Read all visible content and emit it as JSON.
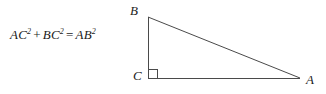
{
  "figure": {
    "background_color": "#ffffff",
    "stroke_color": "#4a4a4a",
    "text_color": "#1b1b1b",
    "width": 326,
    "height": 94
  },
  "equation": {
    "full_text": "AC2 + BC2 = AB2",
    "term1_base": "AC",
    "term1_exponent": "2",
    "operator_plus": "+",
    "term2_base": "BC",
    "term2_exponent": "2",
    "operator_equals": "=",
    "term3_base": "AB",
    "term3_exponent": "2"
  },
  "triangle": {
    "vertices": [
      {
        "name": "B",
        "label": "B",
        "x": 148,
        "y": 17
      },
      {
        "name": "C",
        "label": "C",
        "x": 148,
        "y": 78
      },
      {
        "name": "A",
        "label": "A",
        "x": 300,
        "y": 78
      }
    ],
    "right_angle_vertex": "C",
    "right_angle_marker_size": 9,
    "sides": [
      {
        "name": "BC",
        "from": "B",
        "to": "C"
      },
      {
        "name": "CA",
        "from": "C",
        "to": "A"
      },
      {
        "name": "AB",
        "from": "A",
        "to": "B"
      }
    ]
  }
}
